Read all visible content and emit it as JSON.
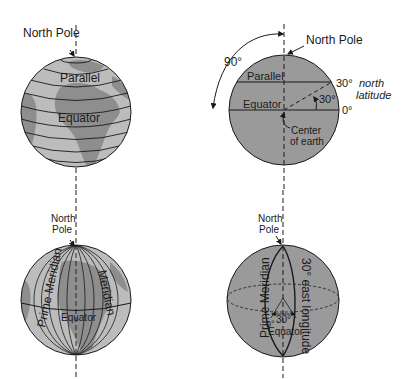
{
  "colors": {
    "ocean": "#bcbcbc",
    "land": "#8e8e8e",
    "globe_fill": "#9a9a9a",
    "line": "#1a1a1a",
    "background": "#ffffff"
  },
  "panels": {
    "top_left": {
      "north_pole": "North Pole",
      "parallel": "Parallel",
      "equator": "Equator"
    },
    "top_right": {
      "north_pole": "North Pole",
      "arc_angle": "90°",
      "parallel": "Parallel",
      "equator": "Equator",
      "lat_30": "30°",
      "north": "north",
      "latitude": "latitude",
      "angle_30": "30°",
      "zero": "0°",
      "center_line1": "Center",
      "center_line2": "of earth"
    },
    "bottom_left": {
      "north": "North",
      "pole": "Pole",
      "prime_meridian": "Prime Meridian",
      "meridian": "Meridian",
      "equator": "Equator"
    },
    "bottom_right": {
      "north": "North",
      "pole": "Pole",
      "prime_meridian": "Prime Meridian",
      "east_longitude": "30° east longitude",
      "zero": "0°",
      "angle_30": "30°",
      "equator": "Equator"
    }
  }
}
